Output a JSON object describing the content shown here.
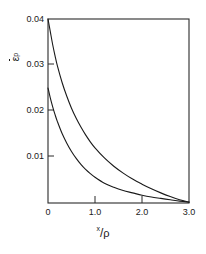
{
  "chart_data": {
    "type": "line",
    "title": "",
    "subtitle": "",
    "xlabel": "x/ρ",
    "xlabel_numerator": "x",
    "xlabel_denominator": "ρ",
    "ylabel": "ε̄ᵖ",
    "ylabel_symbol": "ε",
    "ylabel_superscript": "p",
    "xlim": [
      0,
      3.0
    ],
    "ylim": [
      0,
      0.04
    ],
    "xticks": [
      0,
      1.0,
      2.0,
      3.0
    ],
    "xtick_labels": [
      "0",
      "1.0",
      "2.0",
      "3.0"
    ],
    "yticks": [
      0.01,
      0.02,
      0.03,
      0.04
    ],
    "ytick_labels": [
      "0.01",
      "0.02",
      "0.03",
      "0.04"
    ],
    "grid": false,
    "legend": null,
    "legend_position": "none",
    "frame": "box",
    "tick_direction": "in",
    "line_color": "#1a1a1a",
    "background_color": "#ffffff",
    "series": [
      {
        "name": "upper-curve",
        "x": [
          0.0,
          0.05,
          0.1,
          0.15,
          0.2,
          0.3,
          0.4,
          0.5,
          0.6,
          0.7,
          0.8,
          0.9,
          1.0,
          1.2,
          1.4,
          1.6,
          1.8,
          2.0,
          2.2,
          2.4,
          2.6,
          2.8,
          3.0
        ],
        "values": [
          0.04,
          0.0372,
          0.0344,
          0.032,
          0.0298,
          0.0262,
          0.0232,
          0.0206,
          0.0184,
          0.0165,
          0.0148,
          0.0133,
          0.012,
          0.0098,
          0.008,
          0.0065,
          0.0052,
          0.0041,
          0.0031,
          0.0022,
          0.0014,
          0.0007,
          0.0002
        ]
      },
      {
        "name": "lower-curve",
        "x": [
          0.0,
          0.05,
          0.1,
          0.15,
          0.2,
          0.3,
          0.4,
          0.5,
          0.6,
          0.7,
          0.8,
          0.9,
          1.0,
          1.2,
          1.4,
          1.6,
          1.8,
          2.0,
          2.2,
          2.4,
          2.6,
          2.8,
          3.0
        ],
        "values": [
          0.025,
          0.0228,
          0.0209,
          0.0192,
          0.0177,
          0.0151,
          0.013,
          0.0112,
          0.0097,
          0.0084,
          0.0073,
          0.0064,
          0.0056,
          0.0043,
          0.0034,
          0.0027,
          0.0022,
          0.0017,
          0.0013,
          0.001,
          0.0007,
          0.0004,
          0.0002
        ]
      }
    ]
  },
  "axes": {
    "x_tick_labels": [
      "0",
      "1.0",
      "2.0",
      "3.0"
    ],
    "y_tick_labels": [
      "0.01",
      "0.02",
      "0.03",
      "0.04"
    ]
  }
}
